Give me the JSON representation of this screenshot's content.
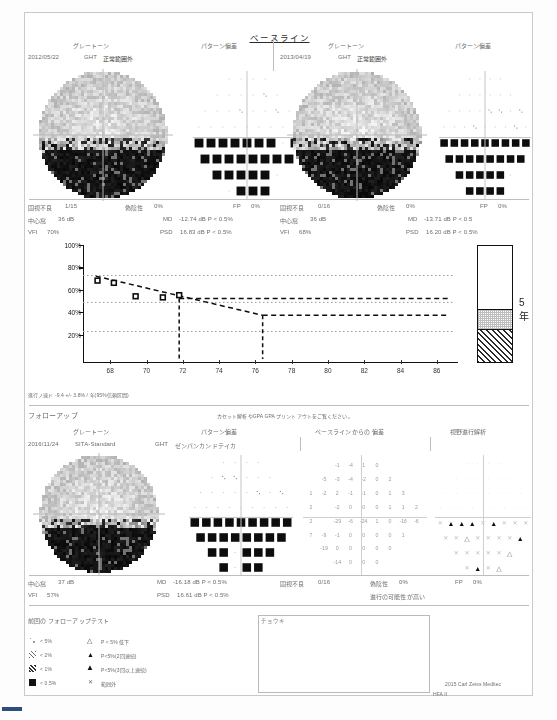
{
  "report": {
    "baseline_title": "ベースライン",
    "followup_title": "フォローアップ",
    "gpa_note": "カセット解析やGPA GPA プリントアウトをご覧ください。",
    "copyright": "2015 Carl Zeiss Meditec",
    "device": "HFA II"
  },
  "columns": {
    "graytone": "グレートーン",
    "pattern_dev": "パターン偏差",
    "baseline_dev": "ベースラインからの 偏差",
    "progression": "視野進行解析",
    "ght": "GHT",
    "ght_value_1": "正常範囲外",
    "ght_value_2": "正常範囲外",
    "ght_value_fu": "ゼンパンカンドテイカ"
  },
  "baseline_exams": [
    {
      "date": "2012/05/22",
      "ght": "GHT",
      "ght_result": "正常範囲外",
      "fixation_label": "固視不良",
      "fixation_value": "1/15",
      "false_neg_label": "偽陰性",
      "false_neg_value": "0%",
      "fp_label": "FP",
      "fp_value": "0%",
      "fovea_label": "中心窩",
      "fovea_value": "36 dB",
      "md_label": "MD",
      "md_value": "-12.74 dB P < 0.5%",
      "vfi_label": "VFI",
      "vfi_value": "70%",
      "psd_label": "PSD",
      "psd_value": "16.83 dB P < 0.5%"
    },
    {
      "date": "2013/04/19",
      "ght": "GHT",
      "ght_result": "正常範囲外",
      "fixation_label": "固視不良",
      "fixation_value": "0/16",
      "false_neg_label": "偽陰性",
      "false_neg_value": "0%",
      "fp_label": "FP",
      "fp_value": "0%",
      "fovea_label": "中心窩",
      "fovea_value": "36 dB",
      "md_label": "MD",
      "md_value": "-13.71 dB P < 0.5",
      "vfi_label": "VFI",
      "vfi_value": "68%",
      "psd_label": "PSD",
      "psd_value": "16.20 dB P < 0.5%"
    }
  ],
  "followup_exam": {
    "date": "2016/11/24",
    "strategy": "SITA-Standard",
    "ght": "GHT",
    "ght_result": "ゼンパンカンドテイカ",
    "fovea_label": "中心窩",
    "fovea_value": "37 dB",
    "md_label": "MD",
    "md_value": "-16.18 dB P < 0.5%",
    "fixation_label": "固視不良",
    "fixation_value": "0/16",
    "false_neg_label": "偽陰性",
    "false_neg_value": "0%",
    "fp_label": "FP",
    "fp_value": "0%",
    "vfi_label": "VFI",
    "vfi_value": "57%",
    "psd_label": "PSD",
    "psd_value": "16.61 dB P < 0.5%",
    "progression_status": "進行の可能性が高い"
  },
  "progression_rate": {
    "text": "進行ノ速ド -9.4 +/- 3.8% / 年(95%信頼区間)"
  },
  "legend": {
    "prev_followup": "前回の フォローアップテスト",
    "p5": "< 5%",
    "p2": "< 2%",
    "p1": "< 1%",
    "p05": "< 0.5%",
    "t_p5": "P < 5% 低下",
    "t_p5_2": "P<5%(2回連続)",
    "t_p5_3": "P<5%(3回以上連続)",
    "t_x": "範囲外",
    "five_year": "5年"
  },
  "chart_data": {
    "type": "line",
    "title": "VFI",
    "xlabel": "",
    "ylabel": "VFI %",
    "xlim": [
      66.5,
      87
    ],
    "ylim": [
      0,
      100
    ],
    "grid": true,
    "xtick_labels": [
      "68",
      "70",
      "72",
      "74",
      "76",
      "78",
      "80",
      "82",
      "84",
      "86"
    ],
    "xticks": [
      68,
      70,
      72,
      74,
      76,
      78,
      80,
      82,
      84,
      86
    ],
    "ytick_labels": [
      "100%",
      "80%",
      "60%",
      "40%",
      "20%"
    ],
    "yticks": [
      100,
      80,
      60,
      40,
      20
    ],
    "series": [
      {
        "name": "VFI measurements",
        "marker": "open-square",
        "x": [
          67.3,
          68.2,
          69.4,
          70.9,
          71.8
        ],
        "y": [
          70,
          68,
          56,
          55,
          57
        ]
      },
      {
        "name": "regression",
        "style": "dashed",
        "x": [
          67.2,
          76.4
        ],
        "y": [
          74,
          39
        ]
      },
      {
        "name": "upper-projection",
        "style": "dashed",
        "x": [
          71.8,
          86.6
        ],
        "y": [
          54,
          54
        ]
      },
      {
        "name": "lower-projection",
        "style": "dashed",
        "x": [
          76.4,
          86.6
        ],
        "y": [
          39,
          39
        ]
      }
    ],
    "gridlines_y": [
      75,
      51,
      25
    ],
    "vertical_markers_x": [
      71.8,
      76.4
    ],
    "bar": {
      "label": "5年",
      "segments": [
        {
          "name": "white",
          "from": 54,
          "to": 100
        },
        {
          "name": "stippled",
          "from": 39,
          "to": 54
        },
        {
          "name": "hatched",
          "from": 0,
          "to": 39
        }
      ]
    }
  },
  "numeric_deviation": {
    "rows": [
      [
        "",
        "",
        "-1",
        "-4",
        "1",
        "0",
        "",
        "",
        ""
      ],
      [
        "",
        "-5",
        "-3",
        "-4",
        "-2",
        "0",
        "2",
        "",
        ""
      ],
      [
        "1",
        "-2",
        "2",
        "-1",
        "-1",
        "0",
        "1",
        "3",
        ""
      ],
      [
        "2",
        "",
        "-2",
        "0",
        "0",
        "0",
        "1",
        "1",
        "2"
      ],
      [
        "2",
        "",
        "-29",
        "-6",
        "-24",
        "1",
        "0",
        "-16",
        "-6"
      ],
      [
        "7",
        "-9",
        "-1",
        "0",
        "0",
        "0",
        "0",
        "1",
        ""
      ],
      [
        "",
        "-19",
        "0",
        "0",
        "0",
        "0",
        "0",
        "",
        ""
      ],
      [
        "",
        "",
        "-14",
        "0",
        "0",
        "0",
        "",
        "",
        ""
      ]
    ]
  }
}
